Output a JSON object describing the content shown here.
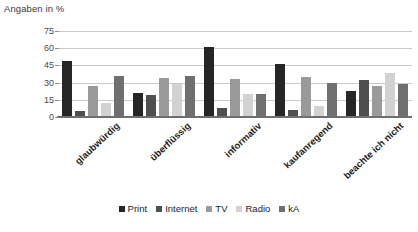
{
  "chart_data": {
    "type": "bar",
    "title": "",
    "subtitle": "",
    "ylabel": "Angaben in %",
    "xlabel": "",
    "ylim": [
      0,
      75
    ],
    "yticks": [
      0,
      15,
      30,
      45,
      60,
      75
    ],
    "grid": true,
    "legend_position": "bottom",
    "categories": [
      "glaubwürdig",
      "überflüssig",
      "informativ",
      "kaufanregend",
      "beachte ich nicht"
    ],
    "series": [
      {
        "name": "Print",
        "color": "#262626",
        "values": [
          49,
          21,
          61,
          46,
          23
        ]
      },
      {
        "name": "Internet",
        "color": "#4f4f4f",
        "values": [
          5,
          19,
          8,
          6,
          32
        ]
      },
      {
        "name": "TV",
        "color": "#9a9a9a",
        "values": [
          27,
          34,
          33,
          35,
          27
        ]
      },
      {
        "name": "Radio",
        "color": "#d2d2d2",
        "values": [
          12,
          29,
          20,
          10,
          38
        ]
      },
      {
        "name": "kA",
        "color": "#6f6f6f",
        "values": [
          36,
          36,
          20,
          30,
          29
        ]
      }
    ]
  },
  "colors": {
    "gridline": "#c9c9c9",
    "axis": "#6e6e6e",
    "text": "#1d1d1d",
    "background": "#ffffff"
  }
}
